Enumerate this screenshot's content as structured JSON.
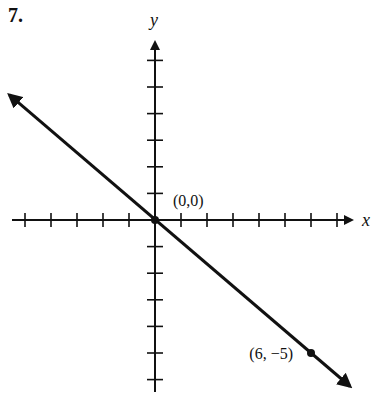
{
  "problem_number": "7.",
  "axes": {
    "x_label": "x",
    "y_label": "y"
  },
  "points": [
    {
      "label": "(0,0)",
      "x": 0,
      "y": 0
    },
    {
      "label": "(6, −5)",
      "x": 6,
      "y": -5
    }
  ],
  "chart_data": {
    "type": "line",
    "title": "",
    "xlabel": "x",
    "ylabel": "y",
    "xlim": [
      -6,
      8
    ],
    "ylim": [
      -6,
      7
    ],
    "x_ticks": [
      -5,
      -4,
      -3,
      -2,
      -1,
      1,
      2,
      3,
      4,
      5,
      6,
      7
    ],
    "y_ticks": [
      -6,
      -5,
      -4,
      -3,
      -2,
      -1,
      1,
      2,
      3,
      4,
      5,
      6
    ],
    "grid": false,
    "legend": null,
    "series": [
      {
        "name": "line through (0,0) and (6,-5)",
        "x": [
          -5.6,
          0,
          6,
          7.5
        ],
        "y": [
          4.7,
          0,
          -5,
          -6.25
        ],
        "slope": -0.8333,
        "arrows_both_ends": true
      }
    ],
    "annotations": [
      {
        "text": "(0,0)",
        "x": 0,
        "y": 0
      },
      {
        "text": "(6, −5)",
        "x": 6,
        "y": -5
      }
    ]
  }
}
